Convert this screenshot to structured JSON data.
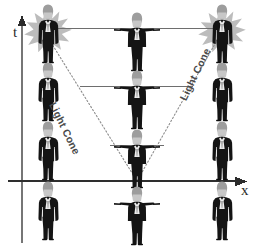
{
  "figure": {
    "type": "spacetime-light-cone-diagram",
    "title": "",
    "background_color": "#ffffff"
  },
  "axes": {
    "vertical": {
      "label": "t",
      "meaning": "time",
      "arrow_direction": "up",
      "color": "#6b6b6b",
      "x_px": 22,
      "y_top_px": 18,
      "y_bottom_px": 243
    },
    "horizontal": {
      "label": "x",
      "meaning": "space",
      "arrow_direction": "right",
      "color": "#2e2e2e",
      "y_px": 181,
      "x_left_px": 8,
      "x_right_px": 247
    }
  },
  "light_cone": {
    "label_left": "Light Cone",
    "label_right": "Light Cone",
    "line_style": "dotted",
    "color": "#8c8c8c",
    "apex": {
      "x": 137,
      "y": 181
    },
    "left_end": {
      "x": 42,
      "y": 30
    },
    "right_end": {
      "x": 223,
      "y": 30
    }
  },
  "rows": [
    {
      "name": "row-top",
      "y": 28,
      "connector": {
        "x_start": 44,
        "x_end": 222,
        "color": "#6b6b6b"
      },
      "left_figure": "observer-with-starburst",
      "center_figure": "observer-arms-out",
      "right_figure": "observer-with-starburst"
    },
    {
      "name": "row-second",
      "y": 86,
      "connector": {
        "x_start": 80,
        "x_end": 192,
        "color": "#6b6b6b"
      },
      "left_figure": "observer-standing",
      "center_figure": "observer-arms-out",
      "right_figure": "observer-standing"
    },
    {
      "name": "row-third",
      "y": 145,
      "connector": {
        "x_start": 110,
        "x_end": 166,
        "color": "#6b6b6b"
      },
      "left_figure": "observer-standing",
      "center_figure": "observer-arms-out",
      "right_figure": "observer-standing"
    },
    {
      "name": "row-bottom",
      "y": 203,
      "connector": null,
      "left_figure": "observer-standing",
      "center_figure": "observer-arms-out",
      "right_figure": "observer-standing"
    }
  ],
  "columns": {
    "left_x": 48,
    "center_x": 137,
    "right_x": 222
  },
  "colors": {
    "figure_body": "#1a1a1a",
    "figure_hair": "#9a9a9a",
    "figure_face": "#c9c9c9",
    "starburst": "#b5b5b5",
    "line": "#6b6b6b",
    "axis_dark": "#2e2e2e",
    "text": "#3a3a3a",
    "background": "#ffffff"
  },
  "icons": {
    "starburst": "starburst-icon",
    "arrow_up": "arrow-up-icon",
    "arrow_right": "arrow-right-icon",
    "person_standing": "person-standing-icon",
    "person_arms_out": "person-arms-out-icon"
  }
}
